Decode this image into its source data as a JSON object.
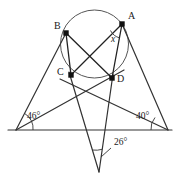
{
  "figure": {
    "canvas": {
      "width": 176,
      "height": 178
    },
    "colors": {
      "stroke": "#333333",
      "circle_stroke": "#555555",
      "point_fill": "#111111",
      "text": "#1a1a1a",
      "background": "#ffffff"
    },
    "circle": {
      "cx": 94.5,
      "cy": 44,
      "r": 34
    },
    "points": [
      {
        "name": "A",
        "label": "A",
        "x": 122,
        "y": 24,
        "label_x": 128,
        "label_y": 11,
        "on_circle": true
      },
      {
        "name": "B",
        "label": "B",
        "x": 66,
        "y": 33,
        "label_x": 54,
        "label_y": 21,
        "on_circle": true
      },
      {
        "name": "C",
        "label": "C",
        "x": 71,
        "y": 75,
        "label_x": 57,
        "label_y": 67,
        "on_circle": true
      },
      {
        "name": "D",
        "label": "D",
        "x": 112,
        "y": 78,
        "label_x": 117,
        "label_y": 74,
        "on_circle": true
      }
    ],
    "vertices": {
      "left": {
        "name": "left-vertex",
        "x": 16,
        "y": 130
      },
      "right": {
        "name": "right-vertex",
        "x": 168,
        "y": 130
      },
      "bottom": {
        "name": "bottom-vertex",
        "x": 99,
        "y": 172
      }
    },
    "baseline": {
      "x1": 8,
      "y1": 130,
      "x2": 172,
      "y2": 130
    },
    "chords": [
      {
        "name": "chord-bc",
        "from": "B",
        "to": "C"
      },
      {
        "name": "chord-ad",
        "from": "A",
        "to": "D"
      },
      {
        "name": "chord-bd",
        "from": "B",
        "to": "D"
      },
      {
        "name": "chord-ac",
        "from": "A",
        "to": "C"
      }
    ],
    "rays": [
      {
        "name": "ray-left-to-b",
        "from": "left-vertex",
        "through": "B"
      },
      {
        "name": "ray-left-to-d",
        "from": "left-vertex",
        "through": "D"
      },
      {
        "name": "ray-right-to-a",
        "from": "right-vertex",
        "through": "A"
      },
      {
        "name": "ray-right-to-c",
        "from": "right-vertex",
        "through": "C"
      },
      {
        "name": "ray-bottom-to-c",
        "from": "bottom-vertex",
        "through": "C"
      },
      {
        "name": "ray-bottom-to-d",
        "from": "bottom-vertex",
        "through": "D"
      }
    ],
    "angles": [
      {
        "name": "angle-left",
        "label": "46°",
        "value": 46,
        "label_x": 27,
        "label_y": 117,
        "vertex": "left-vertex"
      },
      {
        "name": "angle-right",
        "label": "40°",
        "value": 40,
        "label_x": 138,
        "label_y": 117,
        "vertex": "right-vertex"
      },
      {
        "name": "angle-bottom",
        "label": "26°",
        "value": 26,
        "label_x": 113,
        "label_y": 141,
        "vertex": "bottom-vertex",
        "leader_line": {
          "x1": 111,
          "y1": 148,
          "x2": 101,
          "y2": 157
        }
      },
      {
        "name": "angle-x-at-a",
        "label": "x",
        "value": null,
        "label_x": 111,
        "label_y": 34,
        "vertex": "A",
        "italic": true
      }
    ]
  }
}
